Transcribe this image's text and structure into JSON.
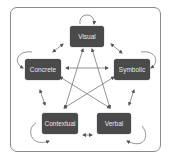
{
  "diagram": {
    "type": "network",
    "nodes": [
      {
        "id": "visual",
        "label": "Visual"
      },
      {
        "id": "concrete",
        "label": "Concrete"
      },
      {
        "id": "symbolic",
        "label": "Symbolic"
      },
      {
        "id": "contextual",
        "label": "Contextual"
      },
      {
        "id": "verbal",
        "label": "Verbal"
      }
    ],
    "edges": [
      {
        "from": "visual",
        "to": "concrete",
        "bidirectional": true
      },
      {
        "from": "visual",
        "to": "symbolic",
        "bidirectional": true
      },
      {
        "from": "visual",
        "to": "contextual",
        "bidirectional": true
      },
      {
        "from": "visual",
        "to": "verbal",
        "bidirectional": true
      },
      {
        "from": "concrete",
        "to": "symbolic",
        "bidirectional": true
      },
      {
        "from": "concrete",
        "to": "contextual",
        "bidirectional": true
      },
      {
        "from": "concrete",
        "to": "verbal",
        "bidirectional": true
      },
      {
        "from": "symbolic",
        "to": "contextual",
        "bidirectional": true
      },
      {
        "from": "symbolic",
        "to": "verbal",
        "bidirectional": true
      },
      {
        "from": "contextual",
        "to": "verbal",
        "bidirectional": true
      }
    ],
    "self_loops": [
      "visual",
      "concrete",
      "symbolic",
      "contextual",
      "verbal"
    ],
    "colors": {
      "node_fill": "#4a4a4a",
      "node_text": "#e8e8e8",
      "arrow": "#555555",
      "frame": "#8a8a8a"
    }
  }
}
